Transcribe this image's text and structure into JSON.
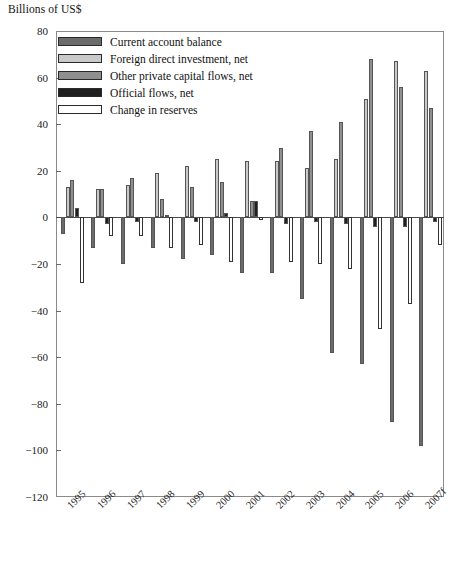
{
  "chart_data": {
    "type": "bar",
    "title": "Billions of US$",
    "subtitle": "",
    "xlabel": "",
    "ylabel": "Billions of US$",
    "ylim": [
      -120,
      80
    ],
    "ytick_step": 20,
    "yticks": [
      80,
      60,
      40,
      20,
      0,
      -20,
      -40,
      -60,
      -80,
      -100,
      -120
    ],
    "ytick_labels": [
      "80",
      "60",
      "40",
      "20",
      "0",
      "−20",
      "−40",
      "−60",
      "−80",
      "−100",
      "−120"
    ],
    "grid": false,
    "legend_position": "top-left",
    "categories": [
      "1995",
      "1996",
      "1997",
      "1998",
      "1999",
      "2000",
      "2001",
      "2002",
      "2003",
      "2004",
      "2005",
      "2006",
      "2007f"
    ],
    "series": [
      {
        "name": "Current account balance",
        "color": "#6b6b6b",
        "values": [
          -7,
          -13,
          -20,
          -13,
          -18,
          -16,
          -24,
          -24,
          -35,
          -58,
          -63,
          -88,
          -98
        ]
      },
      {
        "name": "Foreign direct investment, net",
        "color": "#c9c9c9",
        "values": [
          13,
          12,
          14,
          19,
          22,
          25,
          24,
          24,
          21,
          25,
          51,
          67,
          63
        ]
      },
      {
        "name": "Other private capital flows, net",
        "color": "#8f8f8f",
        "values": [
          16,
          12,
          17,
          8,
          13,
          15,
          7,
          30,
          37,
          41,
          68,
          56,
          47
        ]
      },
      {
        "name": "Official flows, net",
        "color": "#1f1f1f",
        "values": [
          4,
          -3,
          -2,
          1,
          -2,
          2,
          7,
          -3,
          -2,
          -3,
          -4,
          -4,
          -2
        ]
      },
      {
        "name": "Change in reserves",
        "color": "#ffffff",
        "values": [
          -28,
          -8,
          -8,
          -13,
          -12,
          -19,
          -1,
          -19,
          -20,
          -22,
          -48,
          -37,
          -12
        ]
      }
    ]
  },
  "legend": {
    "items": [
      {
        "label": "Current account balance",
        "color": "#6b6b6b"
      },
      {
        "label": "Foreign direct investment, net",
        "color": "#c9c9c9"
      },
      {
        "label": "Other private capital flows, net",
        "color": "#8f8f8f"
      },
      {
        "label": "Official flows, net",
        "color": "#1f1f1f"
      },
      {
        "label": "Change in reserves",
        "color": "#ffffff"
      }
    ]
  }
}
